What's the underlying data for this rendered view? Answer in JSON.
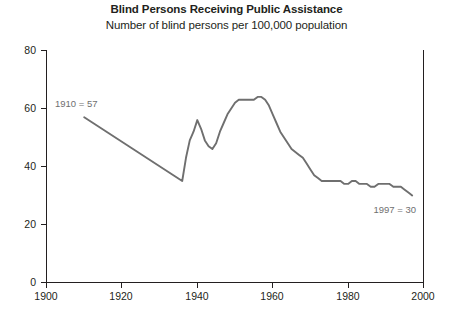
{
  "chart_data": {
    "type": "line",
    "title": "Blind Persons Receiving Public Assistance",
    "subtitle": "Number of blind persons per 100,000 population",
    "xlabel": "",
    "ylabel": "",
    "xlim": [
      1900,
      2000
    ],
    "ylim": [
      0,
      80
    ],
    "xticks": [
      1900,
      1920,
      1940,
      1960,
      1980,
      2000
    ],
    "xtick_labels": [
      "1900",
      "1920",
      "1940",
      "1960",
      "1980",
      "2000"
    ],
    "yticks": [
      0,
      20,
      40,
      60,
      80
    ],
    "ytick_labels": [
      "0",
      "20",
      "40",
      "60",
      "80"
    ],
    "grid": false,
    "legend": null,
    "line_color": "#6f6f6f",
    "series": [
      {
        "name": "Blind persons per 100,000 population",
        "x": [
          1910,
          1936,
          1937,
          1938,
          1939,
          1940,
          1941,
          1942,
          1943,
          1944,
          1945,
          1946,
          1947,
          1948,
          1949,
          1950,
          1951,
          1952,
          1953,
          1954,
          1955,
          1956,
          1957,
          1958,
          1959,
          1960,
          1961,
          1962,
          1963,
          1964,
          1965,
          1966,
          1967,
          1968,
          1969,
          1970,
          1971,
          1972,
          1973,
          1974,
          1975,
          1976,
          1977,
          1978,
          1979,
          1980,
          1981,
          1982,
          1983,
          1984,
          1985,
          1986,
          1987,
          1988,
          1989,
          1990,
          1991,
          1992,
          1993,
          1994,
          1995,
          1996,
          1997
        ],
        "y": [
          57,
          35,
          43,
          49,
          52,
          56,
          53,
          49,
          47,
          46,
          48,
          52,
          55,
          58,
          60,
          62,
          63,
          63,
          63,
          63,
          63,
          64,
          64,
          63,
          61,
          58,
          55,
          52,
          50,
          48,
          46,
          45,
          44,
          43,
          41,
          39,
          37,
          36,
          35,
          35,
          35,
          35,
          35,
          35,
          34,
          34,
          35,
          35,
          34,
          34,
          34,
          33,
          33,
          34,
          34,
          34,
          34,
          33,
          33,
          33,
          32,
          31,
          30
        ]
      }
    ],
    "annotations": [
      {
        "text": "1910 = 57",
        "x": 1910,
        "y": 57,
        "position": "above-right"
      },
      {
        "text": "1997 = 30",
        "x": 1997,
        "y": 30,
        "position": "above-left"
      }
    ]
  },
  "axes": {
    "y_tick_0": "0",
    "y_tick_20": "20",
    "y_tick_40": "40",
    "y_tick_60": "60",
    "y_tick_80": "80",
    "x_tick_1900": "1900",
    "x_tick_1920": "1920",
    "x_tick_1940": "1940",
    "x_tick_1960": "1960",
    "x_tick_1980": "1980",
    "x_tick_2000": "2000"
  },
  "annotation_text": {
    "start": "1910 = 57",
    "end": "1997 = 30"
  }
}
